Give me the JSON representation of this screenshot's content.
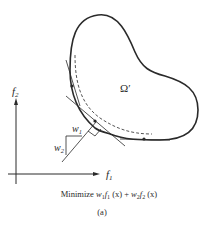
{
  "figure": {
    "region_label": "Ω′",
    "axis_y_label": "f",
    "axis_y_sub": "2",
    "axis_x_label": "f",
    "axis_x_sub": "1",
    "weight1_label": "w",
    "weight1_sub": "1",
    "weight2_label": "w",
    "weight2_sub": "2",
    "caption": {
      "prefix": "Minimize ",
      "w1": "w",
      "w1_sub": "1",
      "f1": "f",
      "f1_sub": "1",
      "x1": " (x) + ",
      "w2": "w",
      "w2_sub": "2",
      "f2": "f",
      "f2_sub": "2",
      "x2": " (x)"
    },
    "subfigure_label": "(a)",
    "colors": {
      "stroke": "#2a2a2a",
      "background": "#ffffff"
    }
  }
}
